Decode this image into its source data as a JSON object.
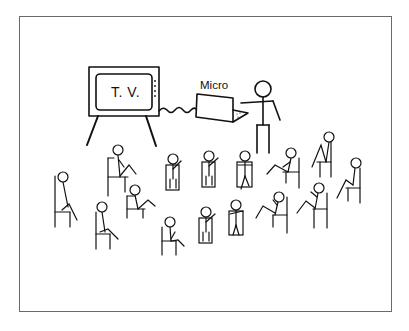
{
  "illustration": {
    "description": "Line drawing of a presenter using a microcomputer connected to a TV, with an audience of seated stick figures",
    "tv": {
      "label": "T. V."
    },
    "computer": {
      "label": "Micro"
    },
    "presenter_count": 1,
    "audience_count": 16,
    "colors": {
      "line": "#111111",
      "frame": "#6a6a6a",
      "background": "#ffffff"
    }
  }
}
